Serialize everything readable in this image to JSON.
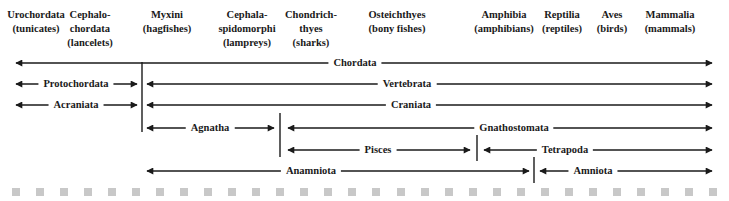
{
  "headers": [
    {
      "name": "Urochordata",
      "common": "(tunicates)",
      "x": 36
    },
    {
      "name": "Cephalo-",
      "name2": "chordata",
      "common": "(lancelets)",
      "x": 90
    },
    {
      "name": "Myxini",
      "common": "(hagfishes)",
      "x": 167
    },
    {
      "name": "Cephala-",
      "name2": "spidomorphi",
      "common": "(lampreys)",
      "x": 247
    },
    {
      "name": "Chondrich-",
      "name2": "thyes",
      "common": "(sharks)",
      "x": 311
    },
    {
      "name": "Osteichthyes",
      "common": "(bony fishes)",
      "x": 397
    },
    {
      "name": "Amphibia",
      "common": "(amphibians)",
      "x": 504
    },
    {
      "name": "Reptilia",
      "common": "(reptiles)",
      "x": 562
    },
    {
      "name": "Aves",
      "common": "(birds)",
      "x": 612
    },
    {
      "name": "Mammalia",
      "common": "(mammals)",
      "x": 670
    }
  ],
  "groups": [
    {
      "label": "Chordata",
      "x1": 16,
      "x2": 712,
      "y": 63,
      "lx": 355
    },
    {
      "label": "Protochordata",
      "x1": 16,
      "x2": 137,
      "y": 84,
      "lx": 76
    },
    {
      "label": "Vertebrata",
      "x1": 147,
      "x2": 712,
      "y": 84,
      "lx": 407
    },
    {
      "label": "Acraniata",
      "x1": 16,
      "x2": 137,
      "y": 105,
      "lx": 76
    },
    {
      "label": "Craniata",
      "x1": 147,
      "x2": 712,
      "y": 105,
      "lx": 411
    },
    {
      "label": "Agnatha",
      "x1": 147,
      "x2": 274,
      "y": 128,
      "lx": 210
    },
    {
      "label": "Gnathostomata",
      "x1": 288,
      "x2": 712,
      "y": 128,
      "lx": 514
    },
    {
      "label": "Pisces",
      "x1": 288,
      "x2": 470,
      "y": 150,
      "lx": 378
    },
    {
      "label": "Tetrapoda",
      "x1": 484,
      "x2": 712,
      "y": 150,
      "lx": 565
    },
    {
      "label": "Anamniota",
      "x1": 147,
      "x2": 529,
      "y": 171,
      "lx": 311
    },
    {
      "label": "Amniota",
      "x1": 540,
      "x2": 712,
      "y": 171,
      "lx": 593
    }
  ],
  "dividers": [
    {
      "x": 142,
      "y1": 62,
      "y2": 132
    },
    {
      "x": 280,
      "y1": 113,
      "y2": 157
    },
    {
      "x": 477,
      "y1": 135,
      "y2": 161
    },
    {
      "x": 534,
      "y1": 157,
      "y2": 183
    }
  ],
  "footer_dots": 30
}
